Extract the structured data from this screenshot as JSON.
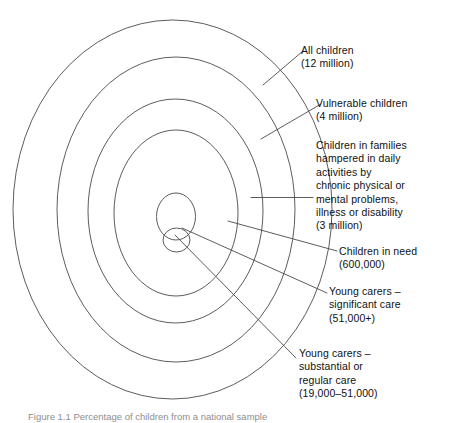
{
  "figure": {
    "caption": "Figure 1.1 Percentage of children from a national sample",
    "diagram_type": "nested-ellipse-venn",
    "stroke_color": "#4a4a4a",
    "background_color": "#ffffff"
  },
  "rings": [
    {
      "id": "all-children",
      "label": "All children\n(12 million)",
      "title": "All children",
      "value": "12 million"
    },
    {
      "id": "vulnerable-children",
      "label": "Vulnerable children\n(4 million)",
      "title": "Vulnerable children",
      "value": "4 million"
    },
    {
      "id": "hampered-families",
      "label": "Children in families\nhampered in daily\nactivities by\nchronic physical or\nmental problems,\nillness or disability\n(3 million)",
      "title": "Children in families hampered in daily activities by chronic physical or mental problems, illness or disability",
      "value": "3 million"
    },
    {
      "id": "children-in-need",
      "label": "Children in need\n(600,000)",
      "title": "Children in need",
      "value": "600,000"
    },
    {
      "id": "young-carers-significant",
      "label": "Young carers –\nsignificant care\n(51,000+)",
      "title": "Young carers – significant care",
      "value": "51,000+"
    },
    {
      "id": "young-carers-substantial",
      "label": "Young carers –\nsubstantial or\nregular care\n(19,000–51,000)",
      "title": "Young carers – substantial or regular care",
      "value": "19,000–51,000"
    }
  ]
}
